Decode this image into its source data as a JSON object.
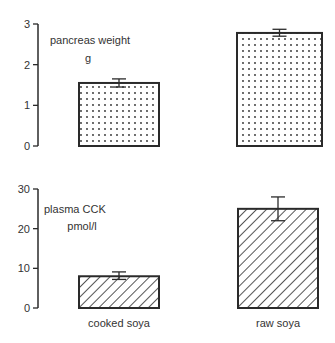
{
  "chart_data": [
    {
      "type": "bar",
      "title": "",
      "panel_label": [
        "pancreas weight",
        "g"
      ],
      "categories": [
        "cooked soya",
        "raw soya"
      ],
      "values": [
        1.55,
        2.78
      ],
      "error_upper": [
        1.65,
        2.87
      ],
      "error_lower": [
        1.45,
        2.7
      ],
      "ylabel": "pancreas weight (g)",
      "xlabel": "",
      "ylim": [
        0,
        3
      ],
      "yticks": [
        0,
        1,
        2,
        3
      ],
      "fill_pattern": "dots",
      "grid": false,
      "legend": "none"
    },
    {
      "type": "bar",
      "title": "",
      "panel_label": [
        "plasma CCK",
        "pmol/l"
      ],
      "categories": [
        "cooked soya",
        "raw soya"
      ],
      "values": [
        8,
        25
      ],
      "error_upper": [
        9.1,
        28
      ],
      "error_lower": [
        7.2,
        22
      ],
      "ylabel": "plasma CCK (pmol/l)",
      "xlabel": "",
      "ylim": [
        0,
        30
      ],
      "yticks": [
        0,
        10,
        20,
        30
      ],
      "fill_pattern": "diagonal-hatch",
      "grid": false,
      "legend": "none"
    }
  ],
  "colors": {
    "ink": "#2a2a2a",
    "background": "#ffffff"
  }
}
